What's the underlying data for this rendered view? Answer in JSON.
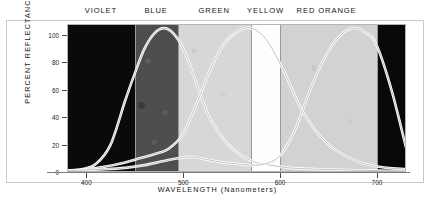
{
  "figure": {
    "background_color": "#ffffff",
    "frame_color": "#c9c9c9"
  },
  "bands": [
    {
      "name": "violet",
      "label": "VIOLET",
      "fill": "#0a0a0a",
      "start_nm": 380,
      "end_nm": 450,
      "label_nm": 415
    },
    {
      "name": "blue",
      "label": "BLUE",
      "fill": "#4e4e4e",
      "start_nm": 450,
      "end_nm": 495,
      "label_nm": 472
    },
    {
      "name": "green",
      "label": "GREEN",
      "fill": "#d7d7d7",
      "start_nm": 495,
      "end_nm": 570,
      "label_nm": 532
    },
    {
      "name": "yellow",
      "label": "YELLOW",
      "fill": "#fdfdfd",
      "start_nm": 570,
      "end_nm": 600,
      "label_nm": 585
    },
    {
      "name": "red-orange",
      "label": "RED ORANGE",
      "fill": "#d2d2d2",
      "start_nm": 600,
      "end_nm": 700,
      "label_nm": 648
    },
    {
      "name": "infrared",
      "label": "",
      "fill": "#090909",
      "start_nm": 700,
      "end_nm": 730,
      "label_nm": 715
    }
  ],
  "chart_data": {
    "type": "line",
    "title": "",
    "xlabel": "WAVELENGTH  (Nanometers)",
    "ylabel": "PERCENT REFLECTANCE",
    "xlim": [
      380,
      730
    ],
    "ylim": [
      0,
      108
    ],
    "xticks": [
      400,
      500,
      600,
      700
    ],
    "xtick_labels": [
      "400",
      "500",
      "600",
      "700"
    ],
    "yticks": [
      0,
      20,
      40,
      60,
      80,
      100
    ],
    "ytick_labels": [
      "0",
      "20",
      "40",
      "60",
      "80",
      "100"
    ],
    "grid": false,
    "legend": null,
    "series": [
      {
        "name": "blue-sensitive",
        "x": [
          380,
          395,
          410,
          425,
          440,
          450,
          460,
          470,
          480,
          490,
          500,
          510,
          520,
          530,
          545,
          560,
          575,
          590,
          610,
          640,
          670,
          700,
          730
        ],
        "values": [
          1,
          2,
          6,
          20,
          52,
          72,
          90,
          101,
          105,
          101,
          90,
          72,
          52,
          36,
          21,
          12,
          7,
          5,
          3,
          2,
          1.5,
          1,
          1
        ]
      },
      {
        "name": "green-sensitive",
        "x": [
          380,
          400,
          420,
          440,
          455,
          470,
          485,
          500,
          515,
          530,
          545,
          560,
          570,
          580,
          590,
          605,
          625,
          650,
          675,
          700,
          730
        ],
        "values": [
          1,
          2,
          4,
          7,
          10,
          13,
          17,
          28,
          52,
          78,
          96,
          104,
          105,
          101,
          92,
          72,
          42,
          20,
          9,
          4,
          2
        ]
      },
      {
        "name": "red-sensitive",
        "x": [
          380,
          400,
          420,
          440,
          460,
          480,
          495,
          510,
          525,
          540,
          555,
          570,
          585,
          600,
          615,
          630,
          645,
          660,
          675,
          690,
          700,
          715,
          730
        ],
        "values": [
          1,
          1.5,
          2,
          3,
          5,
          8,
          10,
          11,
          9,
          7,
          6,
          5,
          6,
          12,
          30,
          58,
          82,
          98,
          105,
          101,
          92,
          60,
          18
        ]
      }
    ],
    "annotations": []
  }
}
